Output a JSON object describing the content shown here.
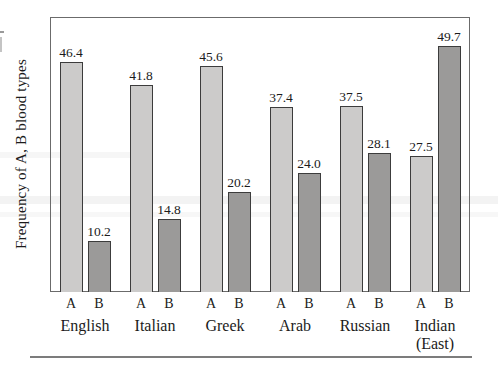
{
  "figure": {
    "ylabel": "Frequency of A, B blood types",
    "colors": {
      "series_A_fill": "#cccbca",
      "series_B_fill": "#9b9a99",
      "bar_border": "#3c3c3c",
      "frame_border": "#6b6b6b",
      "rule": "#7c7c7c"
    }
  },
  "chart_data": {
    "type": "bar",
    "title": "",
    "xlabel": "",
    "ylabel": "Frequency of A, B blood types",
    "categories": [
      "English",
      "Italian",
      "Greek",
      "Arab",
      "Russian",
      "Indian"
    ],
    "category_sublabels": [
      "",
      "",
      "",
      "",
      "",
      "(East)"
    ],
    "bar_tick_labels": [
      "A",
      "B"
    ],
    "series": [
      {
        "name": "A",
        "values": [
          46.4,
          41.8,
          45.6,
          37.4,
          37.5,
          27.5
        ]
      },
      {
        "name": "B",
        "values": [
          10.2,
          14.8,
          20.2,
          24.0,
          28.1,
          49.7
        ]
      }
    ],
    "value_labels": true,
    "value_label_decimals": 1,
    "ylim": [
      0,
      55.5
    ],
    "grid": false,
    "legend_position": "none"
  }
}
